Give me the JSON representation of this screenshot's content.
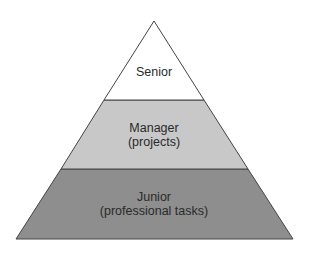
{
  "diagram": {
    "type": "pyramid",
    "levels": [
      {
        "id": "senior",
        "lines": [
          "Senior"
        ],
        "fill": "#ffffff"
      },
      {
        "id": "manager",
        "lines": [
          "Manager",
          "(projects)"
        ],
        "fill": "#c8c8c8"
      },
      {
        "id": "junior",
        "lines": [
          "Junior",
          "(professional tasks)"
        ],
        "fill": "#8e8e8e"
      }
    ],
    "stroke": "#444444"
  }
}
